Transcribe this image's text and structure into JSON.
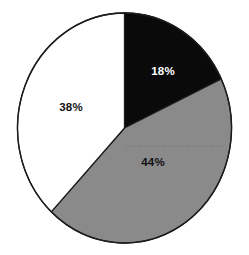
{
  "chart_data": {
    "type": "pie",
    "title": "",
    "subtitle": "",
    "xlabel": "",
    "ylabel": "",
    "legend": "none",
    "grid": false,
    "start_angle_deg": 0,
    "direction": "clockwise",
    "categories": [
      "18%",
      "44%",
      "38%"
    ],
    "values": [
      18,
      44,
      38
    ],
    "total": 100,
    "units": "percent",
    "slices": [
      {
        "label": "18%",
        "value": 18,
        "color": "#0a0a0a",
        "label_color": "#ffffff",
        "start_angle_deg": 0,
        "end_angle_deg": 64.8,
        "label_x": 163,
        "label_y": 72
      },
      {
        "label": "44%",
        "value": 44,
        "color": "#8a8a8a",
        "label_color": "#111111",
        "start_angle_deg": 64.8,
        "end_angle_deg": 223.2,
        "label_x": 153,
        "label_y": 163
      },
      {
        "label": "38%",
        "value": 38,
        "color": "#ffffff",
        "label_color": "#111111",
        "start_angle_deg": 223.2,
        "end_angle_deg": 360,
        "label_x": 71,
        "label_y": 108
      }
    ],
    "geometry": {
      "center_x": 124.5,
      "center_y": 128,
      "radius_x": 107,
      "radius_y": 115
    },
    "style": {
      "background": "#ffffff",
      "outline_color": "#1c1c1c",
      "outline_width": 1.3,
      "guide_line_color": "#6f6f6f",
      "guide_line_dash": "1 2"
    },
    "guide_line": {
      "visible": true,
      "y": 146,
      "x_start": 126,
      "x_end": 224
    }
  }
}
